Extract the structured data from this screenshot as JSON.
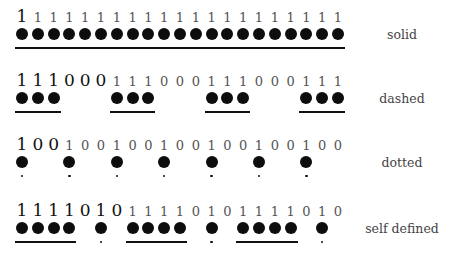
{
  "diagram": {
    "type": "line-style-patterns",
    "rows": [
      {
        "name": "solid",
        "label": "solid",
        "pattern": "1",
        "sequence": "111111111111111111111",
        "highlighted_prefix_length": 1,
        "marker_style": "line",
        "top": 8
      },
      {
        "name": "dashed",
        "label": "dashed",
        "pattern": "111000",
        "sequence": "111000111000111000111",
        "highlighted_prefix_length": 6,
        "marker_style": "line",
        "top": 72
      },
      {
        "name": "dotted",
        "label": "dotted",
        "pattern": "100",
        "sequence": "100100100100100100100",
        "highlighted_prefix_length": 3,
        "marker_style": "dot",
        "top": 136
      },
      {
        "name": "self-defined",
        "label": "self defined",
        "pattern": "1111010",
        "sequence": "111101011110101111010",
        "highlighted_prefix_length": 7,
        "marker_style": "mixed",
        "top": 202
      }
    ],
    "layout": {
      "x0": 22,
      "step": 15.8,
      "dot_offset_y": 20,
      "line_offset_y": 39,
      "label_offset_y": 20
    }
  }
}
